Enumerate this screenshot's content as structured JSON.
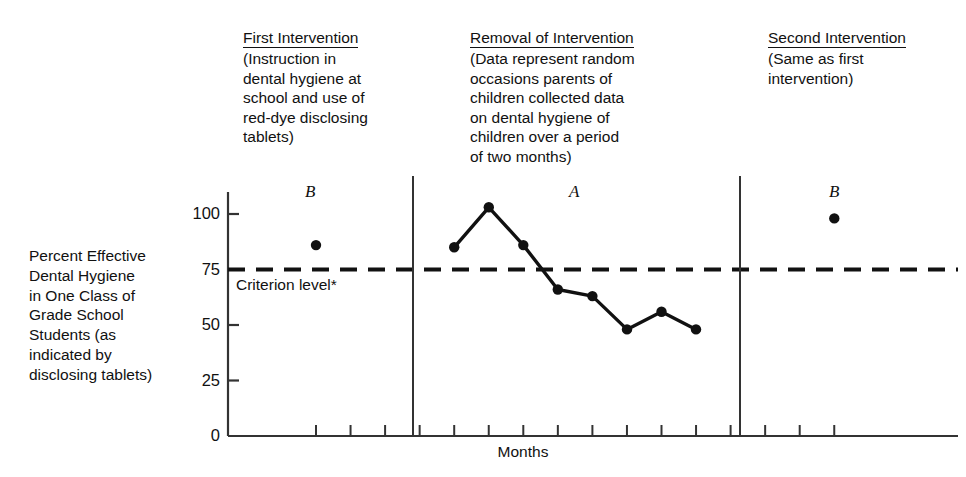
{
  "figure": {
    "headers": [
      {
        "id": "first",
        "title": "First Intervention",
        "body": "(Instruction in\ndental hygiene at\nschool and use of\nred-dye disclosing\ntablets)"
      },
      {
        "id": "removal",
        "title": "Removal of Intervention",
        "body": "(Data represent random\noccasions parents of\nchildren collected data\non dental hygiene of\nchildren over a period\nof two months)"
      },
      {
        "id": "second",
        "title": "Second Intervention",
        "body": "(Same as first\nintervention)"
      }
    ],
    "phase_letters": [
      "B",
      "A",
      "B"
    ],
    "criterion_label": "Criterion level*",
    "axis_color": "#333333",
    "series_color": "#111111"
  },
  "chart_data": {
    "type": "line",
    "title": "",
    "xlabel": "Months",
    "ylabel": "Percent Effective Dental Hygiene in One Class of Grade School Students (as indicated by disclosing tablets)",
    "ylabel_display": "Percent Effective\nDental Hygiene\nin One Class of\nGrade School\nStudents (as\nindicated by\ndisclosing tablets)",
    "ylim": [
      0,
      110
    ],
    "yticks": [
      0,
      25,
      50,
      75,
      100
    ],
    "ytick_labels": [
      "0",
      "25",
      "50",
      "75",
      "100"
    ],
    "grid": false,
    "legend": "none",
    "criterion_level": 75,
    "criterion_line_style": "dashed",
    "phases": [
      {
        "label": "B",
        "name": "First Intervention",
        "points": [
          {
            "x": 1,
            "y": 86
          }
        ]
      },
      {
        "label": "A",
        "name": "Removal of Intervention",
        "points": [
          {
            "x": 5,
            "y": 85
          },
          {
            "x": 6,
            "y": 103
          },
          {
            "x": 7,
            "y": 86
          },
          {
            "x": 8,
            "y": 66
          },
          {
            "x": 9,
            "y": 63
          },
          {
            "x": 10,
            "y": 48
          },
          {
            "x": 11,
            "y": 56
          },
          {
            "x": 12,
            "y": 48
          }
        ]
      },
      {
        "label": "B",
        "name": "Second Intervention",
        "points": [
          {
            "x": 16,
            "y": 98
          }
        ]
      }
    ]
  }
}
